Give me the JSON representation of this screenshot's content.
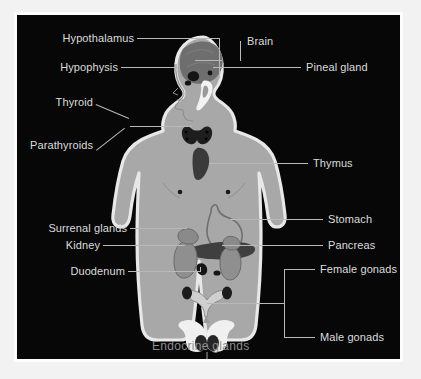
{
  "diagram": {
    "caption": "Endocrine glands",
    "background_color": "#070707",
    "label_color": "#dcdcdc",
    "caption_color": "#8c8c8c",
    "leader_line_color": "#b9b9b9",
    "body_color": "#a8a8a8",
    "body_outline_color": "#e8e8e8",
    "organ_dark_color": "#2b2b2b",
    "organ_mid_color": "#707070",
    "organ_light_color": "#ededed"
  },
  "labels": {
    "left": [
      {
        "id": "hypothalamus",
        "text": "Hypothalamus"
      },
      {
        "id": "hypophysis",
        "text": "Hypophysis"
      },
      {
        "id": "thyroid",
        "text": "Thyroid"
      },
      {
        "id": "parathyroids",
        "text": "Parathyroids"
      },
      {
        "id": "surrenal-glands",
        "text": "Surrenal glands"
      },
      {
        "id": "kidney",
        "text": "Kidney"
      },
      {
        "id": "duodenum",
        "text": "Duodenum"
      }
    ],
    "right": [
      {
        "id": "brain",
        "text": "Brain"
      },
      {
        "id": "pineal-gland",
        "text": "Pineal gland"
      },
      {
        "id": "thymus",
        "text": "Thymus"
      },
      {
        "id": "stomach",
        "text": "Stomach"
      },
      {
        "id": "pancreas",
        "text": "Pancreas"
      },
      {
        "id": "female-gonads",
        "text": "Female gonads"
      },
      {
        "id": "male-gonads",
        "text": "Male gonads"
      }
    ]
  }
}
